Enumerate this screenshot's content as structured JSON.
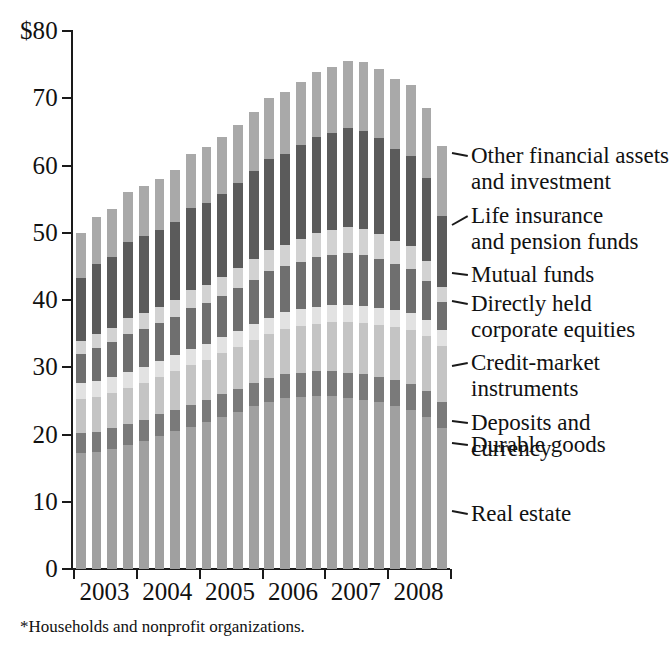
{
  "footnote": "*Households and nonprofit organizations.",
  "axes": {
    "y_ticks": [
      "$80",
      "70",
      "60",
      "50",
      "40",
      "30",
      "20",
      "10",
      "0"
    ],
    "y_tick_values": [
      80,
      70,
      60,
      50,
      40,
      30,
      20,
      10,
      0
    ],
    "x_ticks": [
      "2003",
      "2004",
      "2005",
      "2006",
      "2007",
      "2008"
    ]
  },
  "legend": [
    {
      "label": "Other financial assets\nand investment",
      "color": "#a9a9a9"
    },
    {
      "label": "Life insurance\nand pension funds",
      "color": "#5b5b5b"
    },
    {
      "label": "Mutual funds",
      "color": "#d2d2d2"
    },
    {
      "label": "Directly held\ncorporate equities",
      "color": "#6f6f6f"
    },
    {
      "label": "Credit-market\ninstruments",
      "color": "#e2e2e2"
    },
    {
      "label": "Deposits and currency",
      "color": "#c4c4c4"
    },
    {
      "label": "Durable goods",
      "color": "#7a7a7a"
    },
    {
      "label": "Real estate",
      "color": "#a0a0a0"
    }
  ],
  "chart_data": {
    "type": "bar",
    "subtype": "stacked-column",
    "title": "",
    "xlabel": "",
    "ylabel": "",
    "ylim": [
      0,
      80
    ],
    "units": "trillions of dollars",
    "grid": false,
    "legend_position": "right-callouts",
    "categories": [
      "2003 Q1",
      "2003 Q2",
      "2003 Q3",
      "2003 Q4",
      "2004 Q1",
      "2004 Q2",
      "2004 Q3",
      "2004 Q4",
      "2005 Q1",
      "2005 Q2",
      "2005 Q3",
      "2005 Q4",
      "2006 Q1",
      "2006 Q2",
      "2006 Q3",
      "2006 Q4",
      "2007 Q1",
      "2007 Q2",
      "2007 Q3",
      "2007 Q4",
      "2008 Q1",
      "2008 Q2",
      "2008 Q3",
      "2008 Q4"
    ],
    "series": [
      {
        "name": "Real estate",
        "color": "#a0a0a0",
        "values": [
          17.3,
          17.4,
          17.9,
          18.4,
          19.0,
          19.8,
          20.5,
          21.1,
          21.8,
          22.6,
          23.4,
          24.2,
          24.9,
          25.4,
          25.6,
          25.7,
          25.7,
          25.5,
          25.2,
          24.8,
          24.3,
          23.6,
          22.6,
          20.9
        ]
      },
      {
        "name": "Durable goods",
        "color": "#7a7a7a",
        "values": [
          2.9,
          3.0,
          3.0,
          3.1,
          3.1,
          3.2,
          3.2,
          3.3,
          3.3,
          3.4,
          3.4,
          3.5,
          3.5,
          3.6,
          3.6,
          3.7,
          3.7,
          3.7,
          3.8,
          3.8,
          3.8,
          3.9,
          3.9,
          3.9
        ]
      },
      {
        "name": "Deposits and currency",
        "color": "#c4c4c4",
        "values": [
          5.1,
          5.2,
          5.3,
          5.4,
          5.5,
          5.6,
          5.7,
          5.9,
          6.0,
          6.1,
          6.2,
          6.3,
          6.5,
          6.7,
          6.9,
          7.1,
          7.3,
          7.5,
          7.6,
          7.7,
          7.9,
          8.0,
          8.1,
          8.3
        ]
      },
      {
        "name": "Credit-market instruments",
        "color": "#e2e2e2",
        "values": [
          2.4,
          2.4,
          2.4,
          2.4,
          2.4,
          2.4,
          2.4,
          2.4,
          2.4,
          2.4,
          2.4,
          2.4,
          2.5,
          2.5,
          2.5,
          2.5,
          2.5,
          2.5,
          2.5,
          2.5,
          2.5,
          2.5,
          2.5,
          2.5
        ]
      },
      {
        "name": "Directly held corporate equities",
        "color": "#6f6f6f",
        "values": [
          4.3,
          4.9,
          5.1,
          5.7,
          5.7,
          5.6,
          5.7,
          6.1,
          6.1,
          6.1,
          6.4,
          6.6,
          6.9,
          6.8,
          7.1,
          7.4,
          7.5,
          7.8,
          7.6,
          7.3,
          6.8,
          6.6,
          5.7,
          4.1
        ]
      },
      {
        "name": "Mutual funds",
        "color": "#d2d2d2",
        "values": [
          1.9,
          2.1,
          2.2,
          2.4,
          2.4,
          2.4,
          2.5,
          2.7,
          2.7,
          2.8,
          2.9,
          3.1,
          3.2,
          3.2,
          3.4,
          3.6,
          3.7,
          3.8,
          3.8,
          3.7,
          3.5,
          3.4,
          3.0,
          2.3
        ]
      },
      {
        "name": "Life insurance and pension funds",
        "color": "#5b5b5b",
        "values": [
          9.4,
          10.3,
          10.5,
          11.3,
          11.4,
          11.4,
          11.6,
          12.2,
          12.2,
          12.4,
          12.7,
          13.1,
          13.5,
          13.5,
          13.9,
          14.3,
          14.5,
          14.8,
          14.7,
          14.3,
          13.7,
          13.4,
          12.3,
          10.5
        ]
      },
      {
        "name": "Other financial assets and investment",
        "color": "#a9a9a9",
        "values": [
          6.6,
          7.0,
          7.1,
          7.3,
          7.5,
          7.6,
          7.8,
          8.0,
          8.2,
          8.4,
          8.6,
          8.8,
          9.0,
          9.2,
          9.4,
          9.6,
          9.8,
          10.0,
          10.2,
          10.3,
          10.4,
          10.5,
          10.5,
          10.4
        ]
      }
    ],
    "totals": [
      49.9,
      52.3,
      53.5,
      56.0,
      57.0,
      58.0,
      59.4,
      61.7,
      62.7,
      64.2,
      66.0,
      68.0,
      70.0,
      70.9,
      72.4,
      73.9,
      74.7,
      75.6,
      75.4,
      74.4,
      72.9,
      71.9,
      68.6,
      62.9
    ]
  }
}
